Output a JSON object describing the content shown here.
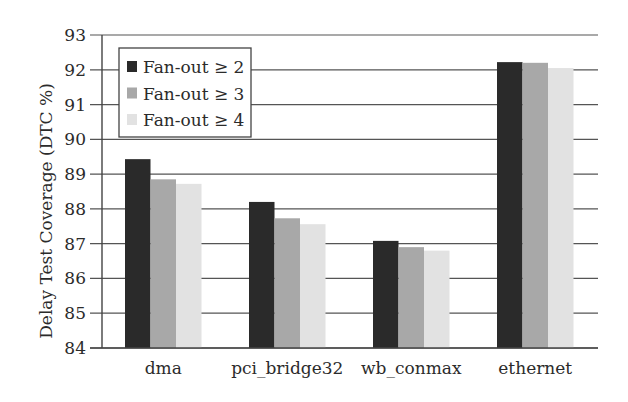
{
  "chart_data": {
    "type": "bar",
    "title": "",
    "xlabel": "",
    "ylabel": "Delay Test Coverage (DTC %)",
    "ylim": [
      84,
      93
    ],
    "yticks": [
      84,
      85,
      86,
      87,
      88,
      89,
      90,
      91,
      92,
      93
    ],
    "grid": true,
    "legend_position": "upper left",
    "categories": [
      "dma",
      "pci_bridge32",
      "wb_conmax",
      "ethernet"
    ],
    "series": [
      {
        "name": "Fan-out ≥ 2",
        "color": "#2a2a2a",
        "values": [
          89.43,
          88.2,
          87.08,
          92.22
        ]
      },
      {
        "name": "Fan-out ≥ 3",
        "color": "#a8a8a8",
        "values": [
          88.85,
          87.73,
          86.9,
          92.2
        ]
      },
      {
        "name": "Fan-out ≥ 4",
        "color": "#e2e2e2",
        "values": [
          88.72,
          87.56,
          86.8,
          92.05
        ]
      }
    ]
  }
}
